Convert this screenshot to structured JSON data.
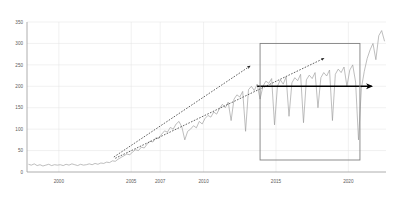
{
  "chart_data": {
    "type": "line",
    "title": "",
    "xlabel": "",
    "ylabel": "",
    "ylim": [
      0,
      350
    ],
    "xlim": [
      1997.8,
      2022.6
    ],
    "grid": true,
    "legend": "none",
    "y_ticks": [
      "0",
      "50",
      "100",
      "150",
      "200",
      "250",
      "300",
      "350"
    ],
    "y_tick_values": [
      0,
      50,
      100,
      150,
      200,
      250,
      300,
      350
    ],
    "x_ticks": [
      "2000",
      "2005",
      "2007",
      "2010",
      "2015",
      "2020"
    ],
    "x_tick_values": [
      2000,
      2005,
      2007,
      2010,
      2015,
      2020
    ],
    "series": [
      {
        "name": "series-1",
        "color": "#9b9b9b",
        "x": [
          1997.9,
          1998.1,
          1998.3,
          1998.5,
          1998.7,
          1998.9,
          1999.1,
          1999.3,
          1999.5,
          1999.7,
          1999.9,
          2000.1,
          2000.3,
          2000.5,
          2000.7,
          2000.9,
          2001.1,
          2001.3,
          2001.5,
          2001.7,
          2001.9,
          2002.1,
          2002.3,
          2002.5,
          2002.7,
          2002.9,
          2003.1,
          2003.3,
          2003.5,
          2003.7,
          2003.9,
          2004.1,
          2004.3,
          2004.5,
          2004.7,
          2004.9,
          2005.1,
          2005.3,
          2005.5,
          2005.7,
          2005.9,
          2006.1,
          2006.3,
          2006.5,
          2006.7,
          2006.9,
          2007.1,
          2007.3,
          2007.5,
          2007.7,
          2007.9,
          2008.1,
          2008.3,
          2008.5,
          2008.7,
          2008.9,
          2009.1,
          2009.3,
          2009.5,
          2009.7,
          2009.9,
          2010.1,
          2010.3,
          2010.5,
          2010.7,
          2010.9,
          2011.1,
          2011.3,
          2011.5,
          2011.7,
          2011.9,
          2012.1,
          2012.3,
          2012.5,
          2012.7,
          2012.9,
          2013.1,
          2013.3,
          2013.5,
          2013.7,
          2013.9,
          2014.1,
          2014.3,
          2014.5,
          2014.7,
          2014.9,
          2015.1,
          2015.3,
          2015.5,
          2015.7,
          2015.9,
          2016.1,
          2016.3,
          2016.5,
          2016.7,
          2016.9,
          2017.1,
          2017.3,
          2017.5,
          2017.7,
          2017.9,
          2018.1,
          2018.3,
          2018.5,
          2018.7,
          2018.9,
          2019.1,
          2019.3,
          2019.5,
          2019.7,
          2019.9,
          2020.1,
          2020.3,
          2020.5,
          2020.7,
          2020.9,
          2021.1,
          2021.3,
          2021.5,
          2021.7,
          2021.9,
          2022.1,
          2022.3,
          2022.5
        ],
        "y": [
          18,
          16,
          19,
          15,
          17,
          14,
          16,
          18,
          15,
          17,
          16,
          17,
          15,
          18,
          16,
          19,
          17,
          15,
          18,
          16,
          17,
          19,
          17,
          20,
          18,
          21,
          20,
          23,
          22,
          26,
          25,
          30,
          34,
          38,
          42,
          40,
          47,
          52,
          50,
          58,
          56,
          65,
          72,
          70,
          80,
          78,
          88,
          96,
          93,
          104,
          100,
          112,
          118,
          105,
          75,
          95,
          100,
          108,
          103,
          118,
          112,
          125,
          132,
          128,
          140,
          135,
          148,
          158,
          150,
          163,
          120,
          170,
          180,
          175,
          188,
          95,
          192,
          200,
          190,
          205,
          170,
          200,
          212,
          207,
          218,
          110,
          200,
          215,
          205,
          222,
          130,
          208,
          220,
          213,
          228,
          115,
          215,
          226,
          218,
          232,
          150,
          220,
          232,
          224,
          238,
          120,
          228,
          240,
          232,
          245,
          200,
          238,
          250,
          210,
          75,
          195,
          235,
          265,
          285,
          300,
          262,
          318,
          330,
          305
        ]
      }
    ],
    "annotations": [
      {
        "name": "upper-dashed-trend-arrow",
        "type": "dashed-arrow",
        "from": [
          2003.8,
          35
        ],
        "to": [
          2013.2,
          247
        ],
        "color": "#3a3a3a"
      },
      {
        "name": "lower-dashed-trend-arrow",
        "type": "dashed-arrow",
        "from": [
          2003.9,
          32
        ],
        "to": [
          2018.3,
          265
        ],
        "color": "#3a3a3a"
      },
      {
        "name": "horizontal-plateau-arrow",
        "type": "solid-arrow",
        "from": [
          2013.7,
          200
        ],
        "to": [
          2021.6,
          200
        ],
        "color": "#000000"
      },
      {
        "name": "highlight-rectangle",
        "type": "rectangle",
        "x_range": [
          2013.9,
          2020.8
        ],
        "y_range": [
          28,
          300
        ],
        "color": "#808080"
      }
    ]
  }
}
